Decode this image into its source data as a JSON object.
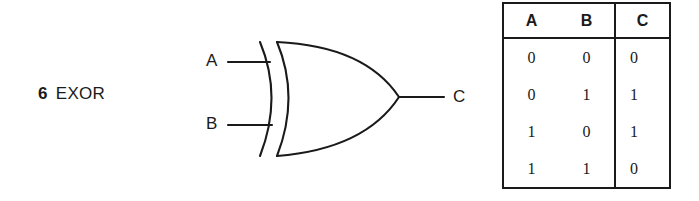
{
  "figure": {
    "number": "6",
    "title": "EXOR",
    "gate_type": "exclusive-or",
    "ink_color": "#1a1a1a",
    "background_color": "#ffffff"
  },
  "gate": {
    "inputs": [
      {
        "label": "A"
      },
      {
        "label": "B"
      }
    ],
    "output": {
      "label": "C"
    }
  },
  "truth_table": {
    "headers": [
      "A",
      "B",
      "C"
    ],
    "input_headers": [
      "A",
      "B"
    ],
    "output_header": "C",
    "rows": [
      {
        "a": "0",
        "b": "0",
        "c": "0"
      },
      {
        "a": "0",
        "b": "1",
        "c": "1"
      },
      {
        "a": "1",
        "b": "0",
        "c": "1"
      },
      {
        "a": "1",
        "b": "1",
        "c": "0"
      }
    ]
  }
}
